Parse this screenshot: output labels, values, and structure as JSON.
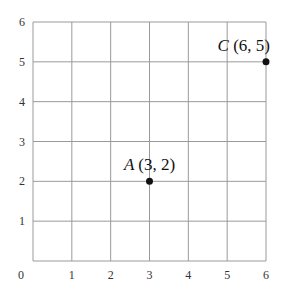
{
  "diagram": {
    "type": "coordinate-grid",
    "x_range": [
      0,
      6
    ],
    "y_range": [
      0,
      6
    ],
    "x_ticks": [
      "0",
      "1",
      "2",
      "3",
      "4",
      "5",
      "6"
    ],
    "y_ticks": [
      "1",
      "2",
      "3",
      "4",
      "5",
      "6"
    ],
    "origin_label": "0",
    "grid_color": "#9a9a9a",
    "points": [
      {
        "name": "A",
        "coords": "(3, 2)",
        "x": 3,
        "y": 2
      },
      {
        "name": "C",
        "coords": "(6, 5)",
        "x": 6,
        "y": 5
      }
    ]
  }
}
